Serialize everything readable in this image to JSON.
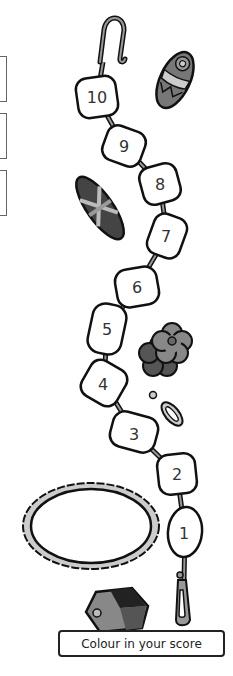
{
  "worksheet": {
    "caption": "Colour in your score",
    "beads": [
      {
        "label": "10",
        "x": 97,
        "y": 97
      },
      {
        "label": "9",
        "x": 124,
        "y": 146
      },
      {
        "label": "8",
        "x": 160,
        "y": 184
      },
      {
        "label": "7",
        "x": 167,
        "y": 236
      },
      {
        "label": "6",
        "x": 137,
        "y": 287
      },
      {
        "label": "5",
        "x": 107,
        "y": 329
      },
      {
        "label": "4",
        "x": 104,
        "y": 383
      },
      {
        "label": "3",
        "x": 134,
        "y": 432
      },
      {
        "label": "2",
        "x": 177,
        "y": 474
      },
      {
        "label": "1",
        "x": 185,
        "y": 532
      }
    ],
    "score_boxes": 3,
    "colors": {
      "outline": "#111111",
      "grey_dark": "#555555",
      "grey_mid": "#888888",
      "grey_light": "#cccccc"
    }
  }
}
